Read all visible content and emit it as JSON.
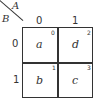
{
  "map": {
    "col_variable": "A",
    "row_variable": "B",
    "col_headers": [
      "0",
      "1"
    ],
    "row_headers": [
      "0",
      "1"
    ],
    "cells": [
      {
        "value": "a",
        "index": "0"
      },
      {
        "value": "d",
        "index": "2"
      },
      {
        "value": "b",
        "index": "1"
      },
      {
        "value": "c",
        "index": "3"
      }
    ]
  }
}
